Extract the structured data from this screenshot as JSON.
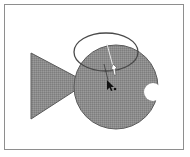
{
  "figure": {
    "colors": {
      "frame_border": "#8e8e8e",
      "fish_fill": "#8c8c8c",
      "fish_outline": "#5a5a5a",
      "ellipse_stroke": "#4a4a4a",
      "cursor": "#111111",
      "guide_line": "#e8e8e8"
    },
    "shapes": {
      "tail": "triangle",
      "body": "circle-with-mouth-notch",
      "ellipse": "unfilled-ellipse",
      "cursor": "arrow-pointer",
      "hollow_pointer": "white-arrow"
    }
  }
}
